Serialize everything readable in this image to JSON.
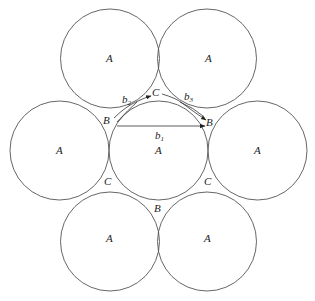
{
  "diagram": {
    "type": "circle-packing",
    "circles": [
      {
        "id": "top-left",
        "cx": 110,
        "cy": 58.5,
        "r": 49.5,
        "label": "A"
      },
      {
        "id": "top-right",
        "cx": 207,
        "cy": 58.5,
        "r": 49.5,
        "label": "A"
      },
      {
        "id": "mid-left",
        "cx": 59.5,
        "cy": 150.5,
        "r": 49.5,
        "label": "A"
      },
      {
        "id": "mid-center",
        "cx": 158.5,
        "cy": 150.5,
        "r": 49.5,
        "label": "A"
      },
      {
        "id": "mid-right",
        "cx": 257.5,
        "cy": 150.5,
        "r": 49.5,
        "label": "A"
      },
      {
        "id": "bottom-left",
        "cx": 110,
        "cy": 241.5,
        "r": 49.5,
        "label": "A"
      },
      {
        "id": "bottom-right",
        "cx": 207,
        "cy": 241.5,
        "r": 49.5,
        "label": "A"
      }
    ],
    "gap_labels": {
      "b_left": "B",
      "b_right": "B",
      "b_bottom": "B",
      "c_top": "C",
      "c_bottom_left": "C",
      "c_bottom_right": "C"
    },
    "vectors": {
      "b1": {
        "base": "b",
        "sub": "1"
      },
      "b2": {
        "base": "b",
        "sub": "2"
      },
      "b3": {
        "base": "b",
        "sub": "3"
      }
    },
    "circle_label": "A"
  }
}
